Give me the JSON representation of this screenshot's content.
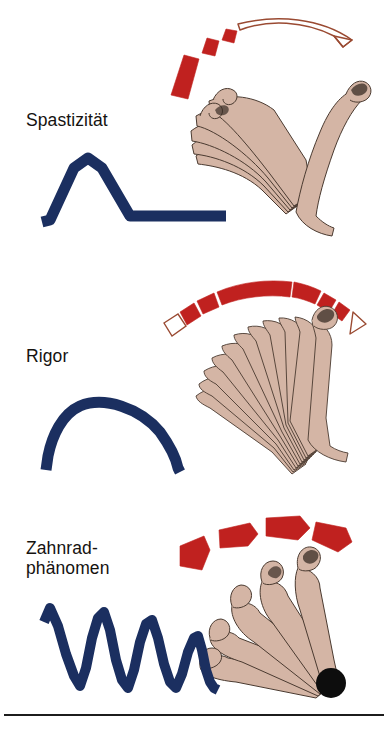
{
  "figure": {
    "title_visible": false,
    "background_color": "#ffffff",
    "width": 388,
    "height": 733,
    "rule_color": "#1c1c1c"
  },
  "palette": {
    "blue_curve": "#1b2f60",
    "red_fill": "#c0211f",
    "red_outline": "#9a4a32",
    "skin_fill": "#d4b5a5",
    "skin_outline": "#4a3a30",
    "pivot_dot": "#0d0d0d",
    "text": "#15120f"
  },
  "panels": [
    {
      "id": "spasticity",
      "label": "Spastizität",
      "label_lines": [
        "Spastizität"
      ],
      "resistance_arc": {
        "name": "spasticity-resistance-arc",
        "pattern": "short-solid-then-long-hollow",
        "solid_segments": 3,
        "hollow_segments": 1,
        "description": "Kurzer kräftiger Widerstand am Anfang, dann plötzliches Nachlassen"
      },
      "waveform": {
        "name": "spasticity-waveform",
        "shape": "sharp-peak-then-flat",
        "points": [
          [
            0,
            0
          ],
          [
            6,
            0
          ],
          [
            22,
            62
          ],
          [
            38,
            70
          ],
          [
            54,
            62
          ],
          [
            86,
            0
          ],
          [
            160,
            0
          ]
        ],
        "description": "Taschenmesserphänomen: steiler Anstieg, abrupter Abfall, danach flach"
      },
      "limb": {
        "name": "spasticity-arm-fan",
        "positions": 5,
        "pivot_dot": false
      }
    },
    {
      "id": "rigor",
      "label": "Rigor",
      "label_lines": [
        "Rigor"
      ],
      "resistance_arc": {
        "name": "rigor-resistance-arc",
        "pattern": "mostly-solid-with-hollow-ends",
        "solid_segments": 6,
        "hollow_segments": 2,
        "description": "Gleichmäßiger Widerstand über den ganzen Bewegungsbogen"
      },
      "waveform": {
        "name": "rigor-waveform",
        "shape": "rounded-plateau",
        "points": [
          [
            0,
            0
          ],
          [
            8,
            10
          ],
          [
            26,
            52
          ],
          [
            60,
            62
          ],
          [
            108,
            56
          ],
          [
            140,
            16
          ],
          [
            150,
            0
          ],
          [
            164,
            0
          ]
        ],
        "description": "Wachsrohrphänomen: anhaltendes gleichmäßiges Plateau"
      },
      "limb": {
        "name": "rigor-arm-fan",
        "positions": 12,
        "pivot_dot": false
      }
    },
    {
      "id": "cogwheel",
      "label": "Zahnrad-\nphänomen",
      "label_lines": [
        "Zahnrad-",
        "phänomen"
      ],
      "resistance_arc": {
        "name": "cogwheel-resistance-arc",
        "pattern": "discrete-separated-blocks",
        "solid_segments": 4,
        "hollow_segments": 0,
        "description": "Ruckartig unterbrochener Widerstand in einzelnen Stufen"
      },
      "waveform": {
        "name": "cogwheel-waveform",
        "shape": "sawtooth-oscillation",
        "cycles": 5,
        "amplitudes": [
          72,
          62,
          55,
          44,
          33
        ],
        "description": "Zahnradphänomen: rhythmisch unterbrochener Widerstand"
      },
      "limb": {
        "name": "cogwheel-arm-fan",
        "positions": 5,
        "pivot_dot": true
      }
    }
  ]
}
